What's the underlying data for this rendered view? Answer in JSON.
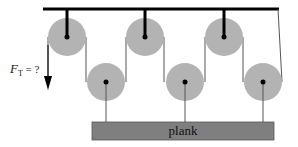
{
  "diagram": {
    "force_label": "F",
    "force_subscript": "T",
    "force_suffix": " = ?",
    "plank_label": "plank",
    "colors": {
      "pulley": "#b3b3b3",
      "plank": "#7f7f7f",
      "line": "#000000",
      "rope": "#555555"
    }
  }
}
